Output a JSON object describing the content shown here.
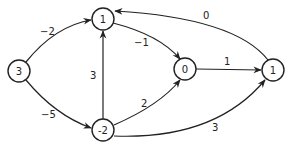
{
  "diagram": {
    "type": "directed-weighted-graph",
    "nodes": [
      {
        "id": "A",
        "label": "3",
        "x": 19,
        "y": 71
      },
      {
        "id": "B",
        "label": "1",
        "x": 103,
        "y": 19
      },
      {
        "id": "C",
        "label": "0",
        "x": 185,
        "y": 69
      },
      {
        "id": "D",
        "label": "1",
        "x": 273,
        "y": 70
      },
      {
        "id": "E",
        "label": "-2",
        "x": 103,
        "y": 130
      }
    ],
    "edges": [
      {
        "from": "A",
        "to": "B",
        "weight": "−2",
        "label_x": 45,
        "label_y": 35
      },
      {
        "from": "A",
        "to": "E",
        "weight": "−5",
        "label_x": 47,
        "label_y": 117
      },
      {
        "from": "E",
        "to": "B",
        "weight": "3",
        "label_x": 93,
        "label_y": 78
      },
      {
        "from": "B",
        "to": "C",
        "weight": "−1",
        "label_x": 143,
        "label_y": 46
      },
      {
        "from": "E",
        "to": "C",
        "weight": "2",
        "label_x": 145,
        "label_y": 107
      },
      {
        "from": "C",
        "to": "D",
        "weight": "1",
        "label_x": 227,
        "label_y": 64
      },
      {
        "from": "D",
        "to": "B",
        "weight": "0",
        "label_x": 206,
        "label_y": 18
      },
      {
        "from": "E",
        "to": "D",
        "weight": "3",
        "label_x": 215,
        "label_y": 130
      }
    ]
  }
}
